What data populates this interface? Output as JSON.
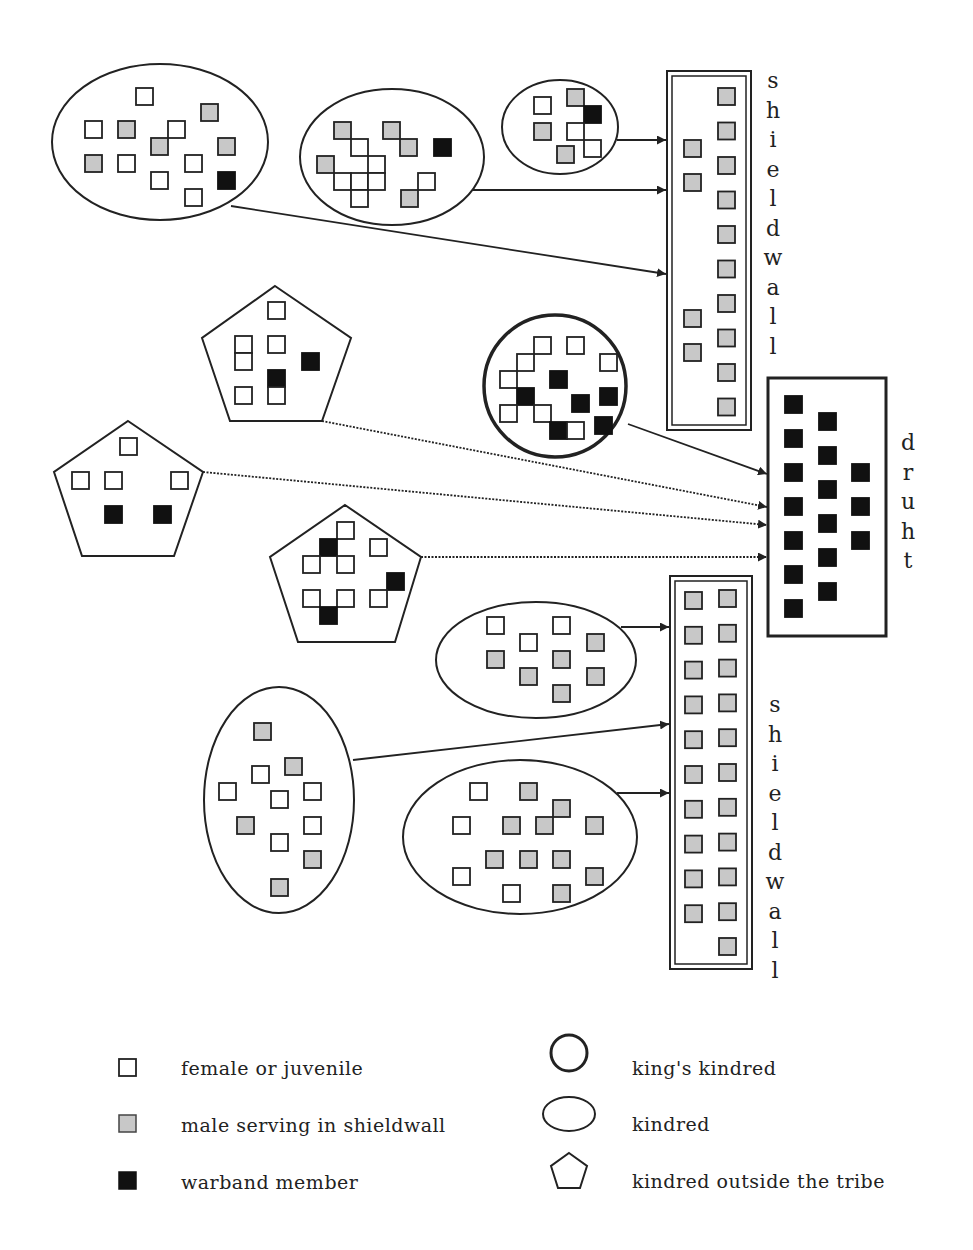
{
  "colors": {
    "female_or_juvenile": "#ffffff",
    "male_shieldwall": "#c8c8c8",
    "warband": "#111111",
    "stroke": "#222222"
  },
  "labels": {
    "shieldwall_top": [
      "s",
      "h",
      "i",
      "e",
      "l",
      "d",
      "w",
      "a",
      "l",
      "l"
    ],
    "druht": [
      "d",
      "r",
      "u",
      "h",
      "t"
    ],
    "shieldwall_bottom": [
      "s",
      "h",
      "i",
      "e",
      "l",
      "d",
      "w",
      "a",
      "l",
      "l"
    ]
  },
  "legend": {
    "members": [
      {
        "type": "female",
        "label": "female or juvenile"
      },
      {
        "type": "male",
        "label": "male serving in shieldwall"
      },
      {
        "type": "warband",
        "label": "warband member"
      }
    ],
    "groups": [
      {
        "type": "kings-kindred",
        "label": "king's kindred"
      },
      {
        "type": "kindred",
        "label": "kindred"
      },
      {
        "type": "outside-kindred",
        "label": "kindred outside the tribe"
      }
    ]
  },
  "groups": [
    {
      "id": "kindred-1",
      "kind": "kindred",
      "counts": {
        "female": 8,
        "male": 5,
        "warband": 1
      },
      "feeds": "shieldwall-top"
    },
    {
      "id": "kindred-2",
      "kind": "kindred",
      "counts": {
        "female": 8,
        "male": 6,
        "warband": 1
      },
      "feeds": "shieldwall-top"
    },
    {
      "id": "kindred-3",
      "kind": "kindred",
      "counts": {
        "female": 4,
        "male": 3,
        "warband": 1
      },
      "feeds": "shieldwall-top"
    },
    {
      "id": "kings-kindred",
      "kind": "kings-kindred",
      "counts": {
        "female": 9,
        "male": 0,
        "warband": 7
      },
      "feeds": "druht"
    },
    {
      "id": "outside-1",
      "kind": "outside",
      "counts": {
        "female": 6,
        "male": 0,
        "warband": 2
      },
      "feeds": "druht"
    },
    {
      "id": "outside-2",
      "kind": "outside",
      "counts": {
        "female": 4,
        "male": 0,
        "warband": 2
      },
      "feeds": "druht"
    },
    {
      "id": "outside-3",
      "kind": "outside",
      "counts": {
        "female": 7,
        "male": 0,
        "warband": 3
      },
      "feeds": "druht"
    },
    {
      "id": "kindred-4",
      "kind": "kindred",
      "counts": {
        "female": 4,
        "male": 6,
        "warband": 0
      },
      "feeds": "shieldwall-bottom"
    },
    {
      "id": "kindred-5",
      "kind": "kindred",
      "counts": {
        "female": 6,
        "male": 6,
        "warband": 0
      },
      "feeds": "shieldwall-bottom"
    },
    {
      "id": "kindred-6",
      "kind": "kindred",
      "counts": {
        "female": 5,
        "male": 12,
        "warband": 0
      },
      "feeds": "shieldwall-bottom"
    }
  ],
  "units": {
    "shieldwall_top": {
      "male": 14
    },
    "druht": {
      "warband": 16
    },
    "shieldwall_bottom": {
      "male": 21
    }
  }
}
